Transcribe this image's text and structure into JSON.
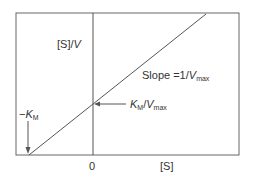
{
  "diagram": {
    "y_axis_label": {
      "bracket": "[S]",
      "slash": "/",
      "var": "V"
    },
    "x_axis_label": "[S]",
    "origin_label": "0",
    "slope_label": {
      "prefix": "Slope =1/",
      "var": "V",
      "sub": "max"
    },
    "intercept_label": {
      "var1": "K",
      "sub1": "M",
      "slash": "/",
      "var2": "V",
      "sub2": "max"
    },
    "x_intercept_label": {
      "minus": "−",
      "var": "K",
      "sub": "M"
    },
    "colors": {
      "line": "#555555",
      "text": "#333333"
    }
  }
}
